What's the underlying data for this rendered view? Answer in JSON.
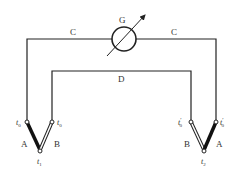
{
  "diagram": {
    "type": "thermocouple-circuit",
    "galvanometer": {
      "label": "G"
    },
    "wires": {
      "outer_left_label": "C",
      "outer_right_label": "C",
      "inner_label": "D"
    },
    "left_junction": {
      "ref_left": "t",
      "ref_left_sub": "0",
      "ref_right": "t",
      "ref_right_sub": "0",
      "leg_left": "A",
      "leg_right": "B",
      "hot": "t",
      "hot_sub": "1"
    },
    "right_junction": {
      "ref_left": "t",
      "ref_left_sub": "0",
      "ref_left_prime": "′",
      "ref_right": "t",
      "ref_right_sub": "0",
      "ref_right_prime": "′",
      "leg_left": "B",
      "leg_right": "A",
      "hot": "t",
      "hot_sub": "2"
    },
    "colors": {
      "line": "#222222",
      "text": "#333333"
    }
  }
}
